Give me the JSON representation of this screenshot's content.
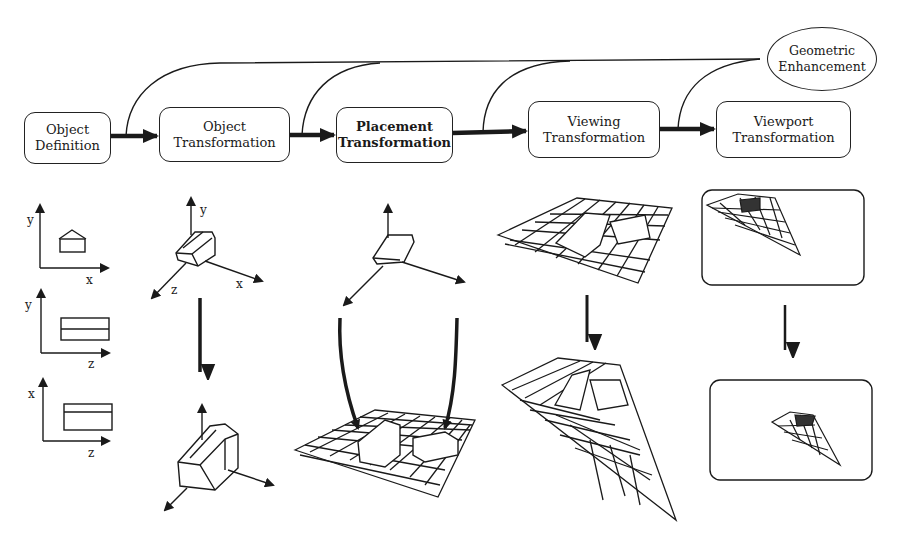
{
  "pipeline": {
    "stages": [
      {
        "id": "object-definition",
        "line1": "Object",
        "line2": "Definition"
      },
      {
        "id": "object-transformation",
        "line1": "Object",
        "line2": "Transformation"
      },
      {
        "id": "placement-transformation",
        "line1": "Placement",
        "line2": "Transformation"
      },
      {
        "id": "viewing-transformation",
        "line1": "Viewing",
        "line2": "Transformation"
      },
      {
        "id": "viewport-transformation",
        "line1": "Viewport",
        "line2": "Transformation"
      }
    ],
    "enhancement": {
      "line1": "Geometric",
      "line2": "Enhancement"
    }
  },
  "illustrations": {
    "definition_views": [
      {
        "vertical_axis": "y",
        "horizontal_axis": "x",
        "view": "front"
      },
      {
        "vertical_axis": "y",
        "horizontal_axis": "z",
        "view": "side"
      },
      {
        "vertical_axis": "x",
        "horizontal_axis": "z",
        "view": "top"
      }
    ],
    "object_transform_axes": {
      "y": "y",
      "z": "z",
      "x": "x"
    }
  }
}
